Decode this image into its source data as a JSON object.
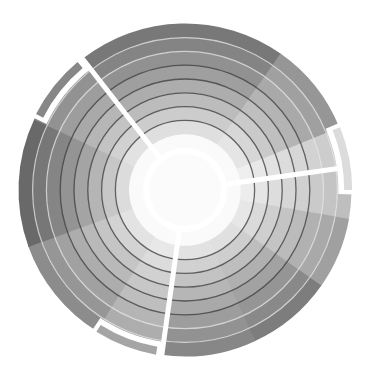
{
  "diagram": {
    "type": "radial-sunburst",
    "center": [
      185,
      190
    ],
    "hub_radius": 42,
    "ring_width": 13.8,
    "ring_count": 9,
    "outer_radius": 166,
    "spoke_color": "#ffffff",
    "dark_ring_color": "#3a3a3a",
    "light_ring_color": "#e6e6e6",
    "dark_ring_indices": [
      2,
      3,
      4,
      5,
      6
    ],
    "light_ring_indices": [
      7,
      8
    ],
    "sectors": [
      {
        "name": "sector-top",
        "start": -128,
        "end": -55,
        "shade": 120
      },
      {
        "name": "sector-upper-right",
        "start": -55,
        "end": -22,
        "shade": 150
      },
      {
        "name": "sector-right-upper",
        "start": -22,
        "end": -8,
        "shade": 200
      },
      {
        "name": "sector-right",
        "start": -8,
        "end": 10,
        "shade": 190
      },
      {
        "name": "sector-right-lower",
        "start": 10,
        "end": 35,
        "shade": 160
      },
      {
        "name": "sector-lower-right",
        "start": 35,
        "end": 65,
        "shade": 125
      },
      {
        "name": "sector-bottom-right",
        "start": 65,
        "end": 98,
        "shade": 135
      },
      {
        "name": "sector-bottom",
        "start": 98,
        "end": 122,
        "shade": 165
      },
      {
        "name": "sector-lower-left",
        "start": 122,
        "end": 160,
        "shade": 140
      },
      {
        "name": "sector-left",
        "start": 160,
        "end": 205,
        "shade": 105
      },
      {
        "name": "sector-upper-left",
        "start": 205,
        "end": 232,
        "shade": 135
      }
    ],
    "spokes": [
      {
        "name": "spoke-upper-left",
        "angle": -128
      },
      {
        "name": "spoke-right",
        "angle": -8
      },
      {
        "name": "spoke-bottom",
        "angle": 98
      }
    ],
    "brackets": [
      {
        "name": "bracket-upper-left",
        "start": -153,
        "end": -130,
        "shade": 135
      },
      {
        "name": "bracket-right",
        "start": -22,
        "end": 0,
        "shade": 220
      },
      {
        "name": "bracket-bottom",
        "start": 100,
        "end": 122,
        "shade": 165
      }
    ]
  }
}
